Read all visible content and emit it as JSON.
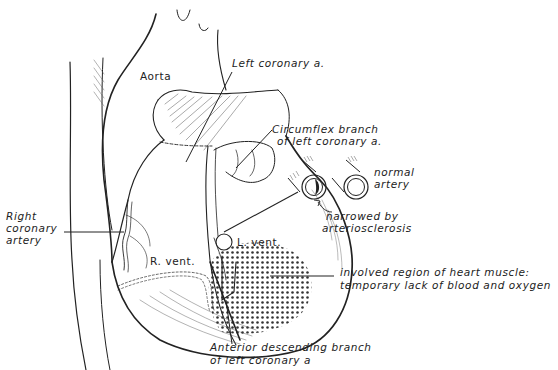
{
  "diagram": {
    "colors": {
      "ink": "#222222",
      "background": "#ffffff",
      "stipple": "#333333"
    },
    "labels": {
      "aorta": "Aorta",
      "left_coronary": "Left coronary a.",
      "circumflex_1": "Circumflex branch",
      "circumflex_2": "of left coronary a.",
      "normal_1": "normal",
      "normal_2": "artery",
      "narrowed_1": "narrowed by",
      "narrowed_2": "arteriosclerosis",
      "right_coronary_1": "Right",
      "right_coronary_2": "coronary",
      "right_coronary_3": "artery",
      "l_vent": "L. vent.",
      "r_vent": "R. vent.",
      "involved_1": "involved region of heart muscle:",
      "involved_2": "temporary lack of blood and oxygen",
      "anterior_1": "Anterior descending branch",
      "anterior_2": "of left coronary a"
    },
    "insets": [
      {
        "name": "narrowed-artery-cross-section",
        "description": "artery lumen partially blocked by plaque"
      },
      {
        "name": "normal-artery-cross-section",
        "description": "open artery lumen"
      }
    ]
  }
}
